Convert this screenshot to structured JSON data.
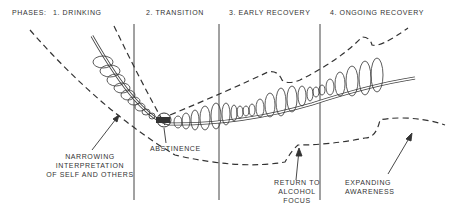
{
  "header": {
    "phases_label": "PHASES:",
    "phases": [
      {
        "label": "1. DRINKING"
      },
      {
        "label": "2. TRANSITION"
      },
      {
        "label": "3. EARLY RECOVERY"
      },
      {
        "label": "4. ONGOING RECOVERY"
      }
    ]
  },
  "annotations": {
    "narrowing": [
      "NARROWING",
      "INTERPRETATION",
      "OF SELF AND OTHERS"
    ],
    "abstinence": "ABSTINENCE",
    "return_focus": [
      "RETURN TO",
      "ALCOHOL",
      "FOCUS"
    ],
    "expanding": [
      "EXPANDING",
      "AWARENESS"
    ]
  },
  "colors": {
    "ink": "#333333",
    "background": "#ffffff"
  }
}
